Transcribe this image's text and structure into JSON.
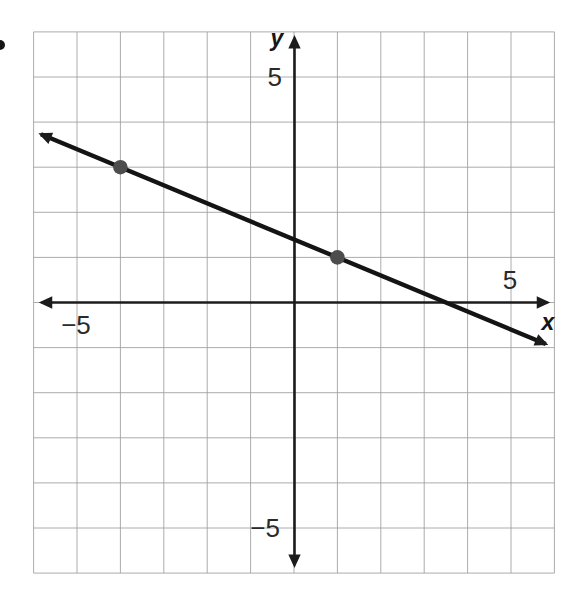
{
  "page": {
    "bullet": "•",
    "background": "#ffffff"
  },
  "chart_data": {
    "type": "line",
    "title": "",
    "xlabel": "x",
    "ylabel": "y",
    "xlim": [
      -6,
      6
    ],
    "ylim": [
      -6,
      6
    ],
    "grid": true,
    "x_tick_labels": [
      {
        "value": 5,
        "label": "5"
      },
      {
        "value": -5,
        "label": "−5"
      }
    ],
    "y_tick_labels": [
      {
        "value": 5,
        "label": "5"
      },
      {
        "value": -5,
        "label": "−5"
      }
    ],
    "marked_points": [
      {
        "x": -4,
        "y": 3
      },
      {
        "x": 1,
        "y": 1
      }
    ],
    "line": {
      "slope": -0.4,
      "y_intercept": 1.4,
      "arrows": "both",
      "draw_from": {
        "x": -5.83,
        "y": 3.73
      },
      "draw_to": {
        "x": 5.8,
        "y": -0.92
      }
    },
    "colors": {
      "background": "#ffffff",
      "grid": "#9e9e9e",
      "axis": "#1c1c1c",
      "line": "#141414",
      "point": "#4d4d4d"
    }
  }
}
